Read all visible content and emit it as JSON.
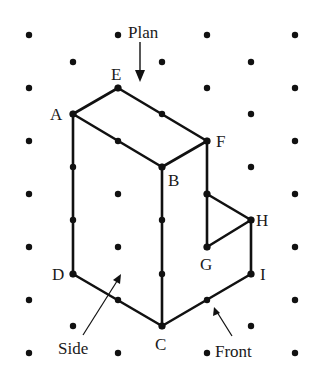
{
  "diagram": {
    "type": "isometric-dot-grid-solid",
    "grid": {
      "dot_color": "#111111",
      "even_row_x": [
        29,
        118,
        207,
        295
      ],
      "odd_row_x": [
        73,
        162,
        251
      ],
      "even_row_y": [
        35,
        88,
        141,
        194,
        247,
        300,
        353
      ],
      "odd_row_y": [
        62,
        114,
        167,
        220,
        274,
        326
      ]
    },
    "vertices": {
      "A": {
        "x": 73,
        "y": 114
      },
      "E": {
        "x": 118,
        "y": 88
      },
      "F": {
        "x": 207,
        "y": 141
      },
      "B": {
        "x": 162,
        "y": 167
      },
      "C": {
        "x": 162,
        "y": 326
      },
      "D": {
        "x": 73,
        "y": 274
      },
      "G": {
        "x": 207,
        "y": 247
      },
      "H": {
        "x": 251,
        "y": 220
      },
      "I": {
        "x": 251,
        "y": 274
      },
      "FG_top": {
        "x": 207,
        "y": 194
      }
    },
    "edges": [
      [
        "A",
        "E"
      ],
      [
        "E",
        "F"
      ],
      [
        "A",
        "B"
      ],
      [
        "B",
        "F"
      ],
      [
        "A",
        "D"
      ],
      [
        "B",
        "C"
      ],
      [
        "D",
        "C"
      ],
      [
        "C",
        "I"
      ],
      [
        "F",
        "FG_top"
      ],
      [
        "FG_top",
        "G"
      ],
      [
        "FG_top",
        "H"
      ],
      [
        "G",
        "H"
      ],
      [
        "H",
        "I"
      ]
    ],
    "labels": {
      "A": "A",
      "B": "B",
      "C": "C",
      "D": "D",
      "E": "E",
      "F": "F",
      "G": "G",
      "H": "H",
      "I": "I"
    },
    "annotations": {
      "plan": "Plan",
      "side": "Side",
      "front": "Front"
    },
    "line_color": "#111111"
  }
}
